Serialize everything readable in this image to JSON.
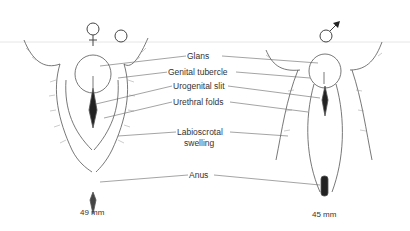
{
  "labels": {
    "glans": "Glans",
    "genital_tubercle": "Genital tubercle",
    "urogenital_slit": "Urogenital slit",
    "urethral_folds": "Urethral folds",
    "labioscrotal_1": "Labioscrotal",
    "labioscrotal_2": "swelling",
    "anus": "Anus"
  },
  "female": {
    "symbol": "female-symbol",
    "size": "49 mm"
  },
  "male": {
    "symbol": "male-symbol",
    "size": "45 mm"
  },
  "colors": {
    "ink": "#333333",
    "lines": "#555555",
    "hatch": "#888888"
  }
}
